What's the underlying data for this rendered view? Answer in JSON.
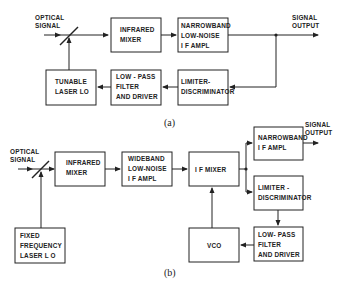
{
  "diagram_a": {
    "caption": "(a)",
    "input_label": [
      "OPTICAL",
      "SIGNAL"
    ],
    "output_label": [
      "SIGNAL",
      "OUTPUT"
    ],
    "blocks": {
      "infrared_mixer": [
        "INFRARED",
        "MIXER"
      ],
      "narrowband_amp": [
        "NARROWBAND",
        "LOW-NOISE",
        "I F  AMPL"
      ],
      "tunable_laser": [
        "TUNABLE",
        "LASER LO"
      ],
      "lowpass_filter": [
        "LOW - PASS",
        "FILTER",
        "AND DRIVER"
      ],
      "limiter_discriminator": [
        "LIMITER-",
        "DISCRIMINATOR"
      ]
    }
  },
  "diagram_b": {
    "caption": "(b)",
    "input_label": [
      "OPTICAL",
      "SIGNAL"
    ],
    "output_label": [
      "SIGNAL",
      "OUTPUT"
    ],
    "blocks": {
      "infrared_mixer": [
        "INFRARED",
        "MIXER"
      ],
      "wideband_amp": [
        "WIDEBAND",
        "LOW-NOISE",
        "I F  AMPL"
      ],
      "if_mixer": [
        "I F  MIXER"
      ],
      "narrowband_amp": [
        "NARROWBAND",
        "I F  AMPL"
      ],
      "limiter_discriminator": [
        "LIMITER -",
        "DISCRIMINATOR"
      ],
      "lowpass_filter": [
        "LOW- PASS",
        "FILTER",
        "AND DRIVER"
      ],
      "vco": [
        "VCO"
      ],
      "fixed_laser": [
        "FIXED",
        "FREQUENCY",
        "LASER L O"
      ]
    }
  }
}
